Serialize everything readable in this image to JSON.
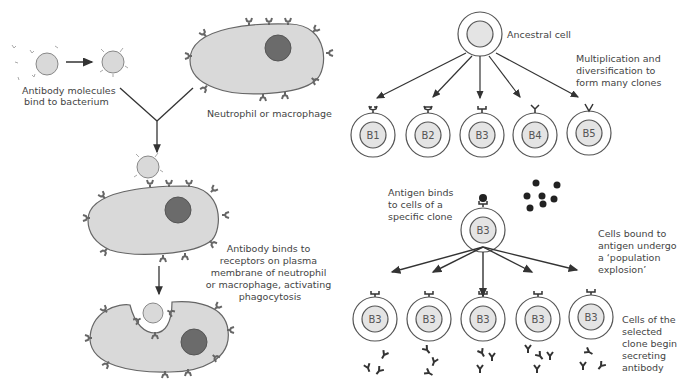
{
  "left_panel": {
    "labels": {
      "antibody_bind": [
        "Antibody molecules",
        "bind to bacterium"
      ],
      "phagocyte": "Neutrophil or macrophage",
      "receptor_bind": [
        "Antibody binds to",
        "receptors on plasma",
        "membrane of neutrophil",
        "or macrophage, activating",
        "phagocytosis"
      ]
    }
  },
  "right_panel": {
    "labels": {
      "ancestral": "Ancestral cell",
      "multiplication": [
        "Multiplication and",
        "diversification to",
        "form many clones"
      ],
      "antigen_binds": [
        "Antigen binds",
        "to cells of a",
        "specific clone"
      ],
      "explosion": [
        "Cells bound to",
        "antigen undergo",
        "a ‘population",
        "explosion’"
      ],
      "secreting": [
        "Cells of the",
        "selected",
        "clone begin",
        "secreting",
        "antibody"
      ]
    },
    "clones": [
      "B1",
      "B2",
      "B3",
      "B4",
      "B5"
    ],
    "selected_clone": "B3",
    "daughter_cells": [
      "B3",
      "B3",
      "B3",
      "B3",
      "B3"
    ]
  },
  "colors": {
    "cell_fill": "#d9d9d9",
    "nucleus": "#6b6b6b",
    "outline": "#555555",
    "receptor": "#666666",
    "antigen": "#222222"
  }
}
